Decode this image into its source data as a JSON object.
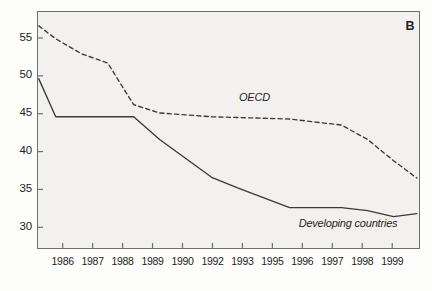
{
  "panel": {
    "label": "B"
  },
  "chart_data": {
    "type": "line",
    "title": "",
    "subtitle": "",
    "xlabel": "",
    "ylabel": "",
    "xlim": [
      1985.3,
      2000.0
    ],
    "ylim": [
      27.2,
      58.5
    ],
    "grid": false,
    "legend_position": "inline-annotations",
    "yticks": [
      30,
      35,
      40,
      45,
      50,
      55
    ],
    "ytick_labels": [
      "30",
      "35",
      "40",
      "45",
      "50",
      "55"
    ],
    "x_tick_positions": [
      1986,
      1987,
      1988,
      1989,
      1990,
      1992,
      1993,
      1995,
      1996,
      1997,
      1998,
      1999
    ],
    "xtick_labels": [
      "1986",
      "1987",
      "1988",
      "1989",
      "1990",
      "1992",
      "1993",
      "1995",
      "1996",
      "1997",
      "1998",
      "1999"
    ],
    "series": [
      {
        "name": "OECD",
        "style": "dashed",
        "color": "#3a3a3a",
        "annotation": "OECD",
        "x": [
          1985.35,
          1986,
          1987,
          1988,
          1989,
          1990,
          1992,
          1993,
          1995,
          1996,
          1997,
          1998,
          1999,
          1999.9
        ],
        "values": [
          56.6,
          54.9,
          52.9,
          51.7,
          46.2,
          45.1,
          44.6,
          44.5,
          44.3,
          43.9,
          43.5,
          41.6,
          38.8,
          36.5
        ]
      },
      {
        "name": "Developing countries",
        "style": "solid",
        "color": "#3a3a3a",
        "annotation": "Developing countries",
        "x": [
          1985.35,
          1986,
          1987,
          1988,
          1989,
          1990,
          1992,
          1993,
          1995,
          1996,
          1997,
          1998,
          1999,
          1999.9
        ],
        "values": [
          49.6,
          44.6,
          44.6,
          44.6,
          44.6,
          41.6,
          36.6,
          35.2,
          32.6,
          32.6,
          32.6,
          32.2,
          31.4,
          31.8
        ]
      }
    ],
    "annotations": [
      {
        "text": "OECD",
        "x": 1993.05,
        "y": 46.9
      },
      {
        "text": "Developing countries",
        "x": 1995.35,
        "y": 30.3
      }
    ]
  }
}
